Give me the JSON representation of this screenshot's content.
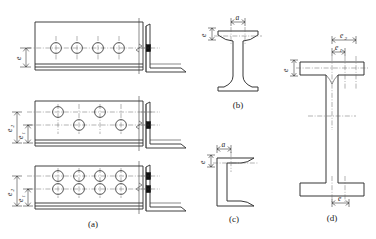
{
  "figure": {
    "panels": [
      {
        "id": "a",
        "caption": "(a)",
        "description": "Angle section plan views with bolt hole arrangements and end elevation",
        "rows": [
          {
            "name": "single-row",
            "hole_count": 4,
            "hole_rows": 1,
            "bolt_marks": 1,
            "labels": [
              {
                "text": "e",
                "sub": "",
                "orientation": "vertical"
              }
            ]
          },
          {
            "name": "staggered-row",
            "hole_count": 4,
            "hole_rows": 2,
            "bolt_marks": 1,
            "labels": [
              {
                "text": "e",
                "sub": "2",
                "orientation": "vertical"
              },
              {
                "text": "e",
                "sub": "1",
                "orientation": "vertical"
              }
            ]
          },
          {
            "name": "double-row",
            "hole_count": 8,
            "hole_rows": 2,
            "bolt_marks": 2,
            "labels": [
              {
                "text": "e",
                "sub": "2",
                "orientation": "vertical"
              },
              {
                "text": "e",
                "sub": "1",
                "orientation": "vertical"
              }
            ]
          }
        ]
      },
      {
        "id": "b",
        "caption": "(b)",
        "description": "I-beam cross section, gauge dimensions on top flange",
        "labels": [
          {
            "text": "a",
            "sub": "",
            "orientation": "horizontal"
          },
          {
            "text": "e",
            "sub": "",
            "orientation": "vertical"
          }
        ]
      },
      {
        "id": "c",
        "caption": "(c)",
        "description": "Channel cross section, gauge dimensions on flange",
        "labels": [
          {
            "text": "a",
            "sub": "",
            "orientation": "horizontal"
          },
          {
            "text": "e",
            "sub": "",
            "orientation": "vertical"
          }
        ]
      },
      {
        "id": "d",
        "caption": "(d)",
        "description": "Wide flange I-section, gauge dimensions on flanges and web",
        "labels": [
          {
            "text": "e",
            "sub": "2",
            "orientation": "horizontal"
          },
          {
            "text": "e",
            "sub": "1",
            "orientation": "horizontal"
          },
          {
            "text": "e",
            "sub": "",
            "orientation": "vertical"
          },
          {
            "text": "e",
            "sub": "",
            "orientation": "horizontal"
          }
        ]
      }
    ]
  },
  "colors": {
    "line": "#2b2b2b",
    "centerline": "#666666",
    "bolt_fill": "#111111",
    "background": "#ffffff"
  }
}
